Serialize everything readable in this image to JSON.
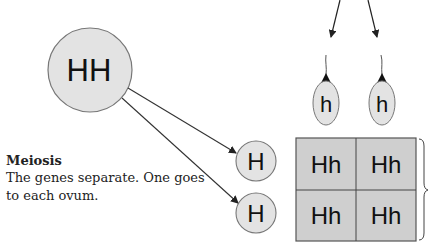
{
  "parent": {
    "genotype": "HH"
  },
  "sperm": [
    {
      "allele": "h"
    },
    {
      "allele": "h"
    }
  ],
  "ova": [
    {
      "allele": "H"
    },
    {
      "allele": "H"
    }
  ],
  "punnett": {
    "rows": [
      [
        "Hh",
        "Hh"
      ],
      [
        "Hh",
        "Hh"
      ]
    ]
  },
  "caption": {
    "title": "Meiosis",
    "body": "The genes separate. One goes to each ovum."
  },
  "colors": {
    "cell_fill": "#d9d9d9",
    "grid_fill": "#c8c8c8",
    "stroke": "#555555",
    "text": "#111111"
  }
}
